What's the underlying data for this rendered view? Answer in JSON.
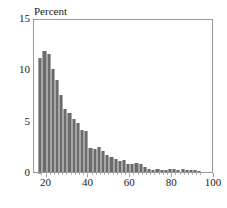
{
  "chart_data": {
    "type": "bar",
    "title": "Percent",
    "xlabel": "",
    "ylabel": "",
    "ylim": [
      0,
      15
    ],
    "xlim": [
      14,
      100
    ],
    "grid": false,
    "legend": null,
    "bar_width": 2,
    "y_ticks": [
      0,
      5,
      10,
      15
    ],
    "x_ticks": [
      20,
      40,
      60,
      80,
      100
    ],
    "y_tick_labels": [
      "0",
      "5",
      "10",
      "15"
    ],
    "x_tick_labels": [
      "20",
      "40",
      "60",
      "80",
      "100"
    ],
    "bar_color": "#6b6b6b",
    "frame_color": "#9a9a9a",
    "text_color": "#1a1a1a",
    "x": [
      17,
      19,
      21,
      23,
      25,
      27,
      29,
      31,
      33,
      35,
      37,
      39,
      41,
      43,
      45,
      47,
      49,
      51,
      53,
      55,
      57,
      59,
      61,
      63,
      65,
      67,
      69,
      71,
      73,
      75,
      77,
      79,
      81,
      83,
      85,
      87,
      89,
      91,
      93
    ],
    "categories": [
      "17",
      "19",
      "21",
      "23",
      "25",
      "27",
      "29",
      "31",
      "33",
      "35",
      "37",
      "39",
      "41",
      "43",
      "45",
      "47",
      "49",
      "51",
      "53",
      "55",
      "57",
      "59",
      "61",
      "63",
      "65",
      "67",
      "69",
      "71",
      "73",
      "75",
      "77",
      "79",
      "81",
      "83",
      "85",
      "87",
      "89",
      "91",
      "93"
    ],
    "values": [
      11.1,
      11.8,
      11.5,
      10.0,
      9.0,
      7.5,
      6.1,
      5.7,
      5.2,
      4.8,
      4.1,
      4.0,
      2.3,
      2.2,
      2.4,
      2.0,
      1.7,
      1.5,
      1.3,
      1.1,
      1.2,
      0.8,
      0.8,
      0.9,
      0.8,
      0.5,
      0.3,
      0.2,
      0.3,
      0.2,
      0.2,
      0.3,
      0.3,
      0.2,
      0.3,
      0.2,
      0.2,
      0.2,
      0.1
    ]
  },
  "caption_ghost": ""
}
